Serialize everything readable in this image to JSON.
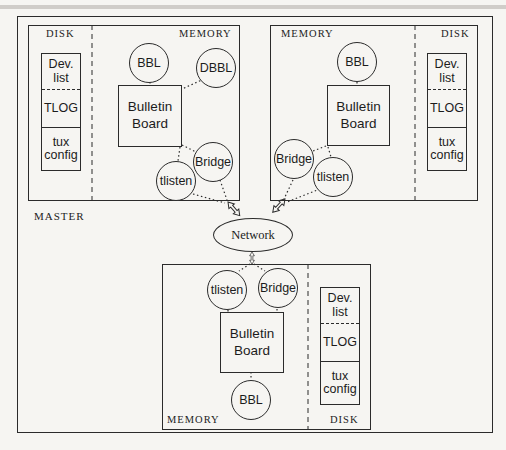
{
  "colors": {
    "paper": "#f6f5f2",
    "ink": "#1c1c1c",
    "line": "#2b2b2b"
  },
  "network": {
    "label": "Network"
  },
  "machines": {
    "master": {
      "tag": "MASTER",
      "sections": {
        "disk": "DISK",
        "memory": "MEMORY"
      },
      "disk_files": {
        "dev_list": "Dev.\nlist",
        "tlog": "TLOG",
        "tux_config": "tux\nconfig"
      },
      "processes": {
        "bbl": "BBL",
        "dbbl": "DBBL",
        "bulletin_board": "Bulletin\nBoard",
        "bridge": "Bridge",
        "tlisten": "tlisten"
      }
    },
    "top_right": {
      "sections": {
        "memory": "MEMORY",
        "disk": "DISK"
      },
      "disk_files": {
        "dev_list": "Dev.\nlist",
        "tlog": "TLOG",
        "tux_config": "tux\nconfig"
      },
      "processes": {
        "bbl": "BBL",
        "bulletin_board": "Bulletin\nBoard",
        "bridge": "Bridge",
        "tlisten": "tlisten"
      }
    },
    "bottom": {
      "sections": {
        "memory": "MEMORY",
        "disk": "DISK"
      },
      "disk_files": {
        "dev_list": "Dev.\nlist",
        "tlog": "TLOG",
        "tux_config": "tux\nconfig"
      },
      "processes": {
        "bbl": "BBL",
        "bulletin_board": "Bulletin\nBoard",
        "bridge": "Bridge",
        "tlisten": "tlisten"
      }
    }
  }
}
